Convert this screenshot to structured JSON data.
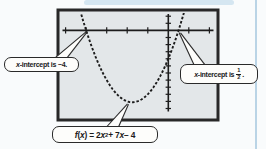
{
  "figure": {
    "bg_color": "#f9fbfc",
    "screen_fill": "#e3e7e9",
    "screen_border_color": "#282828",
    "ink_color": "#1c1c1c",
    "callout_bg": "#fdfdfb"
  },
  "chart_data": {
    "type": "line",
    "title": "",
    "equation": "f(x) = 2x^2 + 7x - 4",
    "coefficients": {
      "a": 2,
      "b": 7,
      "c": -4
    },
    "x_intercepts": [
      -4,
      0.5
    ],
    "xlim": [
      -5.2,
      2.25
    ],
    "ylim": [
      -12.2,
      2.45
    ],
    "x_tick_step": 1,
    "y_tick_step": 1,
    "grid": false,
    "curve_style": "dotted",
    "legend": "none"
  },
  "callouts": {
    "left": {
      "v": "x",
      "rest": "-intercept is −4."
    },
    "right": {
      "v": "x",
      "rest": "-intercept is",
      "frac_num": "1",
      "frac_den": "2",
      "dot": "."
    },
    "formula": {
      "f": "f",
      "p1": "(",
      "x1": "x",
      "p2": ") = 2",
      "x2": "x",
      "sup": "2",
      "p3": " + 7",
      "x3": "x",
      "p4": " − 4"
    }
  }
}
